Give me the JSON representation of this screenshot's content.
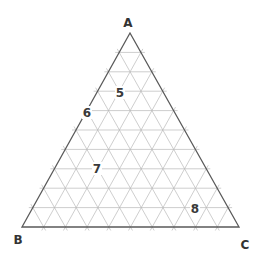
{
  "diagram": {
    "type": "ternary",
    "divisions": 10,
    "vertices": {
      "A": {
        "label": "A",
        "x": 130,
        "y": 33,
        "label_x": 128,
        "label_y": 27
      },
      "B": {
        "label": "B",
        "x": 22,
        "y": 227,
        "label_x": 18,
        "label_y": 244
      },
      "C": {
        "label": "C",
        "x": 239,
        "y": 227,
        "label_x": 245,
        "label_y": 249
      }
    },
    "points": [
      {
        "label": "5",
        "x": 120,
        "y": 97
      },
      {
        "label": "6",
        "x": 87,
        "y": 117
      },
      {
        "label": "7",
        "x": 97,
        "y": 173
      },
      {
        "label": "8",
        "x": 195,
        "y": 213
      }
    ],
    "colors": {
      "outline": "#5a5a5a",
      "grid": "#b9b9b9",
      "text": "#333333",
      "background": "#ffffff"
    }
  }
}
